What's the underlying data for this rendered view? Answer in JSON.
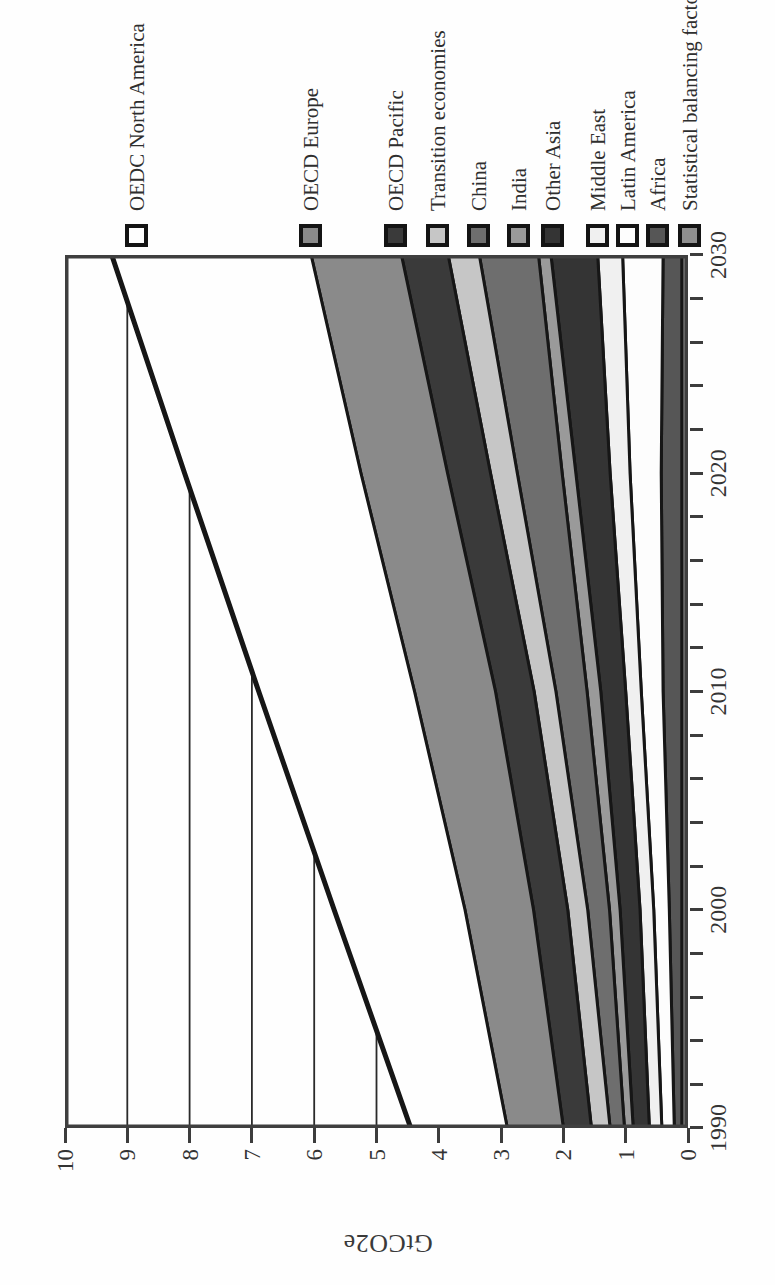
{
  "figure": {
    "ylabel": "GtCO2e",
    "frame_color": "#3f3f3f",
    "boundary_line_color": "#161616",
    "grid_color": "#2a2a2a",
    "text_color": "#2e2e2e"
  },
  "axes": {
    "y_tick_labels": [
      "10",
      "9",
      "8",
      "7",
      "6",
      "5",
      "4",
      "3",
      "2",
      "1",
      "0"
    ],
    "x_tick_labels": [
      "1990",
      "2000",
      "2010",
      "2020",
      "2030"
    ],
    "x_minor_tick_years": 2
  },
  "chart_data": {
    "type": "area",
    "stacked": true,
    "title": "",
    "xlabel": "",
    "ylabel": "GtCO2e",
    "x": [
      1990,
      2000,
      2010,
      2020,
      2030
    ],
    "xlim": [
      1990,
      2030
    ],
    "ylim": [
      0,
      10
    ],
    "grid": "horizontal lines at integer values, visible only above the stacked total",
    "legend_position": "right of plot (appears at top after 90deg page rotation)",
    "series": [
      {
        "name": "OEDC North America",
        "color": "#fefefe",
        "values": [
          1.55,
          2.1,
          2.5,
          2.83,
          3.2
        ]
      },
      {
        "name": "OECD Europe",
        "color": "#8a8a8a",
        "values": [
          0.9,
          1.1,
          1.3,
          1.39,
          1.45
        ]
      },
      {
        "name": "OECD Pacific",
        "color": "#3a3a3a",
        "values": [
          0.45,
          0.55,
          0.62,
          0.69,
          0.75
        ]
      },
      {
        "name": "Transition economies",
        "color": "#c6c6c6",
        "values": [
          0.3,
          0.32,
          0.35,
          0.43,
          0.5
        ]
      },
      {
        "name": "China",
        "color": "#6e6e6e",
        "values": [
          0.23,
          0.35,
          0.5,
          0.72,
          0.95
        ]
      },
      {
        "name": "India",
        "color": "#9a9a9a",
        "values": [
          0.14,
          0.17,
          0.22,
          0.22,
          0.2
        ]
      },
      {
        "name": "Other Asia",
        "color": "#343434",
        "values": [
          0.26,
          0.32,
          0.4,
          0.55,
          0.75
        ]
      },
      {
        "name": "Middle East",
        "color": "#f0f0f0",
        "values": [
          0.2,
          0.22,
          0.25,
          0.32,
          0.4
        ]
      },
      {
        "name": "Latin America",
        "color": "#fdfdfd",
        "values": [
          0.2,
          0.25,
          0.35,
          0.5,
          0.65
        ]
      },
      {
        "name": "Africa",
        "color": "#565656",
        "values": [
          0.12,
          0.2,
          0.3,
          0.33,
          0.3
        ]
      },
      {
        "name": "Statistical balancing factor",
        "color": "#8f8f8f",
        "values": [
          0.1,
          0.1,
          0.1,
          0.1,
          0.1
        ]
      }
    ],
    "series_order_note": "listed top-of-stack to bottom-of-stack; totals rise from ~4.45 GtCO2e (1990) to ~9.25 GtCO2e (2030)",
    "totals": [
      4.45,
      5.68,
      6.89,
      8.08,
      9.25
    ]
  }
}
